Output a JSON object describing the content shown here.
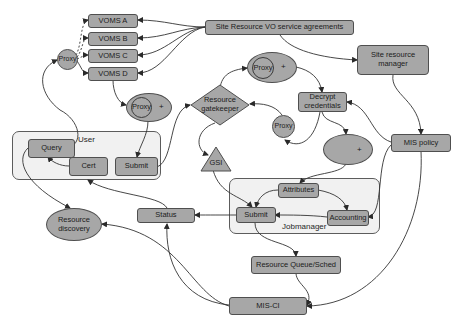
{
  "diagram": {
    "groups": {
      "user": {
        "label": "User"
      },
      "jobmanager": {
        "label": "Jobmanager"
      }
    },
    "nodes": {
      "voms_a": "VOMS A",
      "voms_b": "VOMS B",
      "voms_c": "VOMS C",
      "voms_d": "VOMS D",
      "proxy_left": "Proxy",
      "site_agreements": "Site Resource VO service agreements",
      "site_manager_line1": "Site  resource",
      "site_manager_line2": "manager",
      "proxy_plus_top": {
        "inner": "Proxy",
        "plus": "+"
      },
      "proxy_plus_left": {
        "inner": "Proxy",
        "plus": "+"
      },
      "gatekeeper_line1": "Resource",
      "gatekeeper_line2": "gatekeeper",
      "decrypt_line1": "Decrypt",
      "decrypt_line2": "credentials",
      "proxy_small": "Proxy",
      "plus_ellipse": "+",
      "mis_policy": "MIS policy",
      "query": "Query",
      "cert": "Cert",
      "submit_user": "Submit",
      "gsi": "GSI",
      "attributes": "Attributes",
      "submit_job": "Submit",
      "accounting": "Accounting",
      "status": "Status",
      "discovery_line1": "Resource",
      "discovery_line2": "discovery",
      "queue_sched": "Resource Queue/Sched",
      "mis_ci": "MIS-CI"
    },
    "colors": {
      "node_fill": "#a7a7a7",
      "node_border": "#4f4f4f",
      "group_fill": "#f1f1f1",
      "edge": "#333333",
      "background": "#ffffff"
    }
  }
}
